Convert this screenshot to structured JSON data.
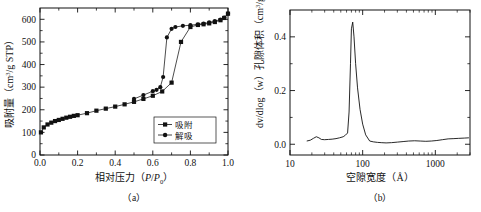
{
  "figure": {
    "panels": [
      {
        "id": "a",
        "caption": "（a）",
        "xlabel_pre": "相对压力（",
        "xlabel_ital1": "P",
        "xlabel_slash": "/",
        "xlabel_ital2": "P",
        "xlabel_sub": "0",
        "xlabel_post": "）",
        "ylabel_pre": "吸附量（cm",
        "ylabel_sup": "3",
        "ylabel_post": "/g STP）",
        "legend": [
          {
            "label": "吸附"
          },
          {
            "label": "解吸"
          }
        ]
      },
      {
        "id": "b",
        "caption": "（b）",
        "xlabel": "空隙宽度（Å）",
        "ylabel_pre": "dv/dlog（w）孔隙体积（cm",
        "ylabel_sup": "3",
        "ylabel_post": "/g）"
      }
    ]
  },
  "chart_data": [
    {
      "type": "scatter",
      "panel": "a",
      "title": "",
      "xlabel": "相对压力（P/P0）",
      "ylabel": "吸附量（cm3/g STP）",
      "xlim": [
        0,
        1.0
      ],
      "ylim": [
        0,
        650
      ],
      "xticks": [
        "0.0",
        "0.2",
        "0.4",
        "0.6",
        "0.8",
        "1.0"
      ],
      "xtick_values": [
        0.0,
        0.2,
        0.4,
        0.6,
        0.8,
        1.0
      ],
      "yticks": [
        "0",
        "100",
        "200",
        "300",
        "400",
        "500",
        "600"
      ],
      "ytick_values": [
        0,
        100,
        200,
        300,
        400,
        500,
        600
      ],
      "grid": false,
      "legend_position": "lower-right",
      "series": [
        {
          "name": "吸附",
          "marker": "filled-square",
          "x": [
            0.005,
            0.02,
            0.04,
            0.06,
            0.08,
            0.1,
            0.12,
            0.14,
            0.16,
            0.18,
            0.2,
            0.25,
            0.3,
            0.35,
            0.4,
            0.45,
            0.5,
            0.55,
            0.6,
            0.65,
            0.7,
            0.75,
            0.8,
            0.84,
            0.87,
            0.9,
            0.93,
            0.96,
            0.98,
            1.0
          ],
          "y": [
            100,
            122,
            135,
            143,
            150,
            155,
            160,
            165,
            169,
            173,
            176,
            185,
            196,
            205,
            214,
            224,
            235,
            248,
            262,
            281,
            320,
            500,
            566,
            575,
            578,
            582,
            588,
            596,
            606,
            625
          ]
        },
        {
          "name": "解吸",
          "marker": "filled-circle",
          "x": [
            1.0,
            0.98,
            0.96,
            0.93,
            0.9,
            0.87,
            0.84,
            0.8,
            0.76,
            0.72,
            0.7,
            0.675,
            0.655,
            0.64,
            0.62,
            0.6,
            0.55,
            0.5
          ],
          "y": [
            625,
            608,
            599,
            592,
            586,
            581,
            578,
            574,
            571,
            566,
            558,
            520,
            345,
            300,
            288,
            282,
            265,
            248
          ]
        }
      ]
    },
    {
      "type": "line",
      "panel": "b",
      "title": "",
      "xlabel": "空隙宽度（Å）",
      "ylabel": "dv/dlog（w）孔隙体积（cm3/g）",
      "xscale": "log",
      "xlim": [
        10,
        3000
      ],
      "ylim": [
        -0.04,
        0.5
      ],
      "xticks": [
        "10",
        "100",
        "1000"
      ],
      "xtick_values": [
        10,
        100,
        1000
      ],
      "yticks": [
        "0.0",
        "0.2",
        "0.4"
      ],
      "ytick_values": [
        0.0,
        0.2,
        0.4
      ],
      "minor_yticks": [
        0.1,
        0.3
      ],
      "grid": false,
      "series": [
        {
          "name": "孔径分布",
          "x": [
            17,
            19,
            21,
            23,
            25,
            27,
            30,
            34,
            38,
            43,
            48,
            54,
            58,
            62,
            65,
            68,
            70,
            73,
            76,
            80,
            85,
            92,
            100,
            110,
            125,
            140,
            160,
            180,
            210,
            250,
            300,
            360,
            430,
            520,
            620,
            740,
            880,
            1050,
            1250,
            1500,
            1800,
            2100,
            2500,
            2900
          ],
          "y": [
            0.012,
            0.015,
            0.022,
            0.028,
            0.024,
            0.018,
            0.017,
            0.018,
            0.019,
            0.021,
            0.024,
            0.028,
            0.034,
            0.042,
            0.12,
            0.3,
            0.43,
            0.455,
            0.4,
            0.3,
            0.21,
            0.13,
            0.075,
            0.035,
            0.012,
            0.009,
            0.007,
            0.006,
            0.005,
            0.006,
            0.008,
            0.01,
            0.012,
            0.013,
            0.012,
            0.011,
            0.012,
            0.014,
            0.017,
            0.02,
            0.021,
            0.022,
            0.023,
            0.024
          ]
        }
      ],
      "peak": {
        "x": 73,
        "y": 0.455
      }
    }
  ]
}
